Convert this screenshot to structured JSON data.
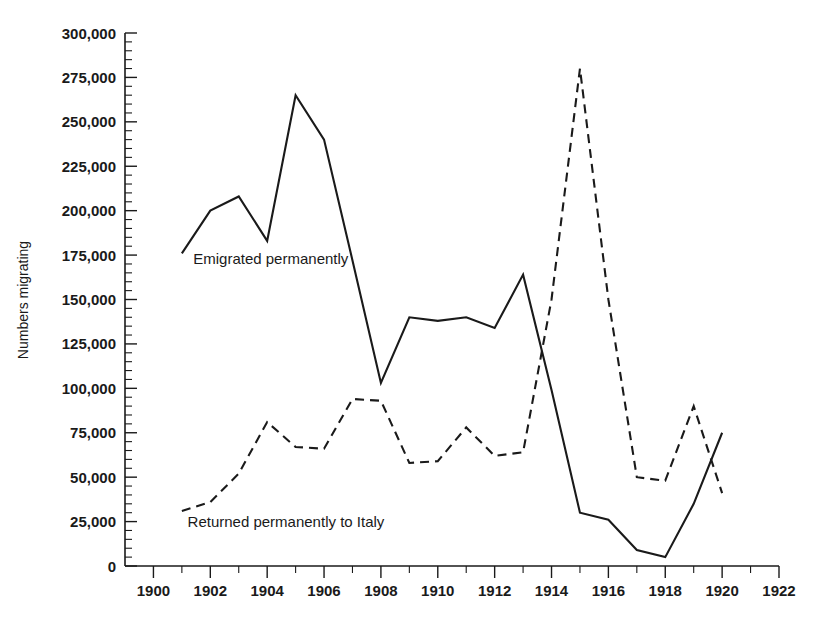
{
  "chart_data": {
    "type": "line",
    "title": "",
    "xlabel": "",
    "ylabel": "Numbers migrating",
    "xlim": [
      1899,
      1922
    ],
    "ylim": [
      0,
      300000
    ],
    "x_ticks": [
      1900,
      1902,
      1904,
      1906,
      1908,
      1910,
      1912,
      1914,
      1916,
      1918,
      1920,
      1922
    ],
    "x_tick_labels": [
      "1900",
      "1902",
      "1904",
      "1906",
      "1908",
      "1910",
      "1912",
      "1914",
      "1916",
      "1918",
      "1920",
      "1922"
    ],
    "x_minor_step": 1,
    "y_ticks": [
      0,
      25000,
      50000,
      75000,
      100000,
      125000,
      150000,
      175000,
      200000,
      225000,
      250000,
      275000,
      300000
    ],
    "y_tick_labels": [
      "0",
      "25,000",
      "50,000",
      "75,000",
      "100,000",
      "125,000",
      "150,000",
      "175,000",
      "200,000",
      "225,000",
      "250,000",
      "275,000",
      "300,000"
    ],
    "y_minor_step": 5000,
    "grid": false,
    "legend_position": "inline-annotation",
    "series": [
      {
        "name": "Emigrated permanently",
        "style": "solid",
        "color": "#1a1a1a",
        "label_x": 1901.4,
        "label_y": 170000,
        "x": [
          1901,
          1902,
          1903,
          1904,
          1905,
          1906,
          1907,
          1908,
          1909,
          1910,
          1911,
          1912,
          1913,
          1914,
          1915,
          1916,
          1917,
          1918,
          1919,
          1920
        ],
        "values": [
          176000,
          200000,
          208000,
          183000,
          265000,
          240000,
          172000,
          103000,
          140000,
          138000,
          140000,
          134000,
          164000,
          99000,
          30000,
          26000,
          9000,
          5000,
          35000,
          75000
        ]
      },
      {
        "name": "Returned permanently to Italy",
        "style": "dashed",
        "color": "#1a1a1a",
        "label_x": 1901.2,
        "label_y": 22000,
        "x": [
          1901,
          1902,
          1903,
          1904,
          1905,
          1906,
          1907,
          1908,
          1909,
          1910,
          1911,
          1912,
          1913,
          1914,
          1915,
          1916,
          1917,
          1918,
          1919,
          1920
        ],
        "values": [
          31000,
          36000,
          52000,
          81000,
          67000,
          66000,
          94000,
          93000,
          58000,
          59000,
          78000,
          62000,
          64000,
          150000,
          280000,
          150000,
          50000,
          48000,
          90000,
          41000
        ]
      }
    ]
  },
  "figure": {
    "background": "#ffffff",
    "ink_color": "#1a1a1a"
  }
}
